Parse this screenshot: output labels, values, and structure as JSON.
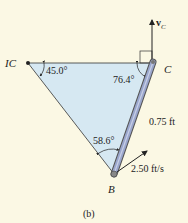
{
  "points": {
    "ic": "IC",
    "c": "C",
    "b": "B"
  },
  "angles": {
    "at_ic": "45.0°",
    "at_c": "76.4°",
    "at_b": "58.6°"
  },
  "dimensions": {
    "bc_length": "0.75 ft"
  },
  "velocities": {
    "vc_label": "v",
    "vc_sub": "C",
    "vb_label": "2.50 ft/s"
  },
  "caption": "(b)",
  "colors": {
    "background": "#fbf8e4",
    "triangle_fill": "#d6e8f2",
    "rod": "#9aa6cc"
  }
}
